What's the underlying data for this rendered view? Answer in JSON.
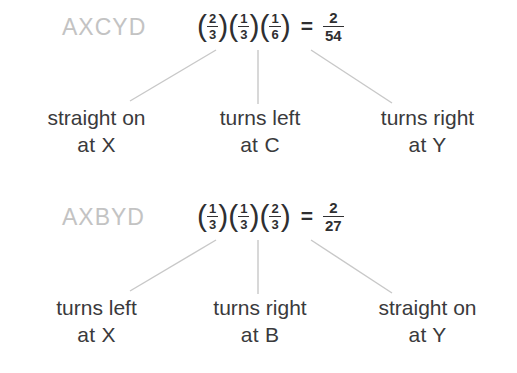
{
  "colors": {
    "background": "#ffffff",
    "text": "#3a3a3c",
    "equation_text": "#2f2f31",
    "path_label": "#c3c3c3",
    "connector_line": "#c8c8c8"
  },
  "groups": [
    {
      "path_label": "AXCYD",
      "equation": {
        "factors": [
          {
            "numerator": "2",
            "denominator": "3"
          },
          {
            "numerator": "1",
            "denominator": "3"
          },
          {
            "numerator": "1",
            "denominator": "6"
          }
        ],
        "equals": "=",
        "result": {
          "numerator": "2",
          "denominator": "54"
        },
        "open_paren": "(",
        "close_paren": ")",
        "plain_text": "(2/3)(1/3)(1/6) = 2/54"
      },
      "leaves": [
        {
          "line1": "straight on",
          "line2": "at X"
        },
        {
          "line1": "turns left",
          "line2": "at  C"
        },
        {
          "line1": "turns right",
          "line2": "at  Y"
        }
      ]
    },
    {
      "path_label": "AXBYD",
      "equation": {
        "factors": [
          {
            "numerator": "1",
            "denominator": "3"
          },
          {
            "numerator": "1",
            "denominator": "3"
          },
          {
            "numerator": "2",
            "denominator": "3"
          }
        ],
        "equals": "=",
        "result": {
          "numerator": "2",
          "denominator": "27"
        },
        "open_paren": "(",
        "close_paren": ")",
        "plain_text": "(1/3)(1/3)(2/3) = 2/27"
      },
      "leaves": [
        {
          "line1": "turns left",
          "line2": "at  X"
        },
        {
          "line1": "turns right",
          "line2": "at  B"
        },
        {
          "line1": "straight on",
          "line2": "at  Y"
        }
      ]
    }
  ]
}
